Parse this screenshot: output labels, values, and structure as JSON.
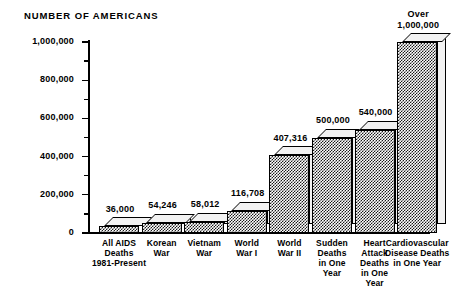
{
  "chart_data": {
    "type": "bar",
    "title": "NUMBER OF AMERICANS",
    "xlabel": "",
    "ylabel": "",
    "ylim": [
      0,
      1000000
    ],
    "grid": false,
    "legend": null,
    "y_major_ticks": [
      "0",
      "200,000",
      "400,000",
      "600,000",
      "800,000",
      "1,000,000"
    ],
    "y_major_tick_values": [
      0,
      200000,
      400000,
      600000,
      800000,
      1000000
    ],
    "y_minor_tick_values": [
      100000,
      300000,
      500000,
      700000,
      900000
    ],
    "categories": [
      "All AIDS Deaths 1981-Present",
      "Korean War",
      "Vietnam War",
      "World War I",
      "World War II",
      "Sudden Deaths in One Year",
      "Heart Attack Deaths in One Year",
      "Cardiovascular Disease Deaths in One Year"
    ],
    "values": [
      36000,
      54246,
      58012,
      116708,
      407316,
      500000,
      540000,
      1000000
    ],
    "value_labels": [
      "36,000",
      "54,246",
      "58,012",
      "116,708",
      "407,316",
      "500,000",
      "540,000",
      "Over 1,000,000"
    ],
    "bars": [
      {
        "value": 36000,
        "value_label_lines": [
          "36,000"
        ],
        "category_lines": [
          "All AIDS",
          "Deaths",
          "1981-Present"
        ]
      },
      {
        "value": 54246,
        "value_label_lines": [
          "54,246"
        ],
        "category_lines": [
          "Korean",
          "War"
        ]
      },
      {
        "value": 58012,
        "value_label_lines": [
          "58,012"
        ],
        "category_lines": [
          "Vietnam",
          "War"
        ]
      },
      {
        "value": 116708,
        "value_label_lines": [
          "116,708"
        ],
        "category_lines": [
          "World",
          "War I"
        ]
      },
      {
        "value": 407316,
        "value_label_lines": [
          "407,316"
        ],
        "category_lines": [
          "World",
          "War II"
        ]
      },
      {
        "value": 500000,
        "value_label_lines": [
          "500,000"
        ],
        "category_lines": [
          "Sudden",
          "Deaths",
          "in One",
          "Year"
        ]
      },
      {
        "value": 540000,
        "value_label_lines": [
          "540,000"
        ],
        "category_lines": [
          "Heart",
          "Attack",
          "Deaths",
          "in One",
          "Year"
        ]
      },
      {
        "value": 1000000,
        "value_label_lines": [
          "Over",
          "1,000,000"
        ],
        "category_lines": [
          "Cardiovascular",
          "Disease Deaths",
          "in One  Year"
        ]
      }
    ],
    "colors": {
      "bar_face": "#1a1a1a",
      "bar_top": "#f2f2f2",
      "bar_side": "#f2f2f2",
      "axis": "#000000",
      "text": "#000000",
      "background": "#ffffff"
    }
  }
}
